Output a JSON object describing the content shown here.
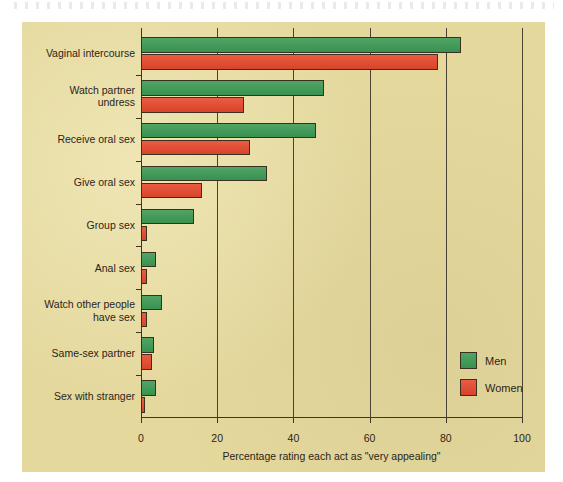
{
  "chart_data": {
    "type": "bar",
    "orientation": "horizontal",
    "title": "",
    "xlabel": "Percentage rating each act as \"very appealing\"",
    "ylabel": "",
    "xlim": [
      0,
      100
    ],
    "xticks": [
      0,
      20,
      40,
      60,
      80,
      100
    ],
    "xtick_labels": [
      "0",
      "20",
      "40",
      "60",
      "80",
      "100"
    ],
    "grid": "vertical gridlines at each x tick",
    "legend_position": "lower right inside plot",
    "categories": [
      "Vaginal intercourse",
      "Watch partner\nundress",
      "Receive oral sex",
      "Give oral sex",
      "Group sex",
      "Anal sex",
      "Watch other people\nhave sex",
      "Same-sex partner",
      "Sex with stranger"
    ],
    "series": [
      {
        "name": "Men",
        "color": "#3d9b55",
        "values": [
          84,
          48,
          46,
          33,
          14,
          4,
          5.5,
          3.5,
          4
        ]
      },
      {
        "name": "Women",
        "color": "#e8492d",
        "values": [
          78,
          27,
          28.5,
          16,
          1.5,
          1.5,
          1.5,
          3,
          1
        ]
      }
    ]
  },
  "legend": {
    "entries": [
      {
        "label": "Men",
        "swatch": "men-color-swatch"
      },
      {
        "label": "Women",
        "swatch": "women-color-swatch"
      }
    ]
  },
  "colors": {
    "background": "#e4d89d",
    "page": "#ffffff",
    "men": "#3d9b55",
    "women": "#e8492d",
    "axis": "#3c352a",
    "text": "#2c2418"
  }
}
